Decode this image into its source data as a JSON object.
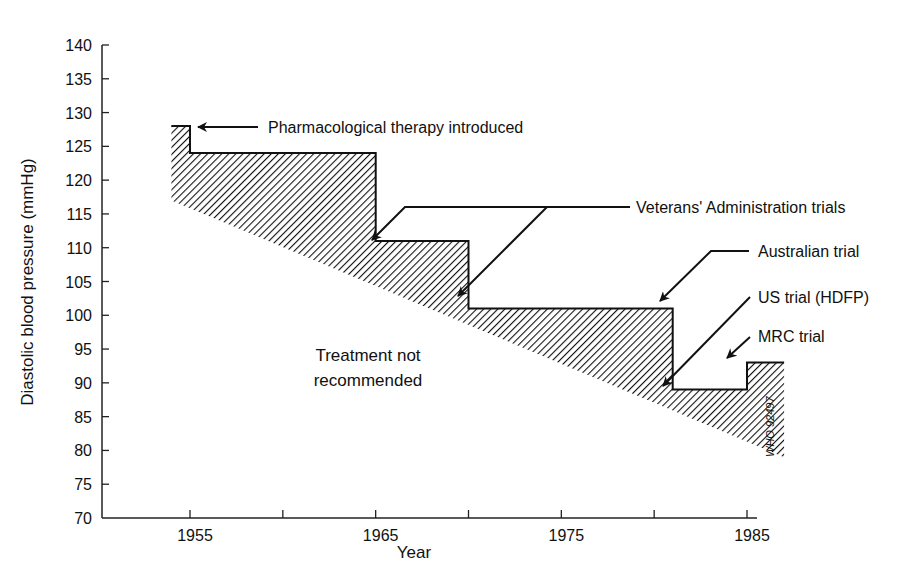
{
  "chart_data": {
    "type": "area",
    "title": "",
    "xlabel": "Year",
    "ylabel": "Diastolic blood pressure (mmHg)",
    "xlim": [
      1950.3,
      1987.5
    ],
    "ylim": [
      70,
      140
    ],
    "grid": false,
    "x_ticks": [
      1955,
      1960,
      1965,
      1970,
      1975,
      1980,
      1985
    ],
    "x_tick_labels": [
      "1955",
      "",
      "1965",
      "",
      "1975",
      "",
      "1985"
    ],
    "y_ticks": [
      70,
      75,
      80,
      85,
      90,
      95,
      100,
      105,
      110,
      115,
      120,
      125,
      130,
      135,
      140
    ],
    "y_tick_labels": [
      "70",
      "75",
      "80",
      "85",
      "90",
      "95",
      "100",
      "105",
      "110",
      "115",
      "120",
      "125",
      "130",
      "135",
      "140"
    ],
    "series": [
      {
        "name": "Treatment threshold (upper step boundary)",
        "step": true,
        "x": [
          1954,
          1955,
          1955,
          1965,
          1965,
          1970,
          1970,
          1981,
          1981,
          1985,
          1985,
          1987
        ],
        "y": [
          128,
          128,
          124,
          124,
          111,
          111,
          101,
          101,
          89,
          89,
          93,
          93
        ]
      },
      {
        "name": "Lower diagonal boundary",
        "x": [
          1954,
          1987
        ],
        "y": [
          117,
          79
        ]
      }
    ],
    "fill": "hatched region between upper step boundary and lower diagonal",
    "annotations": [
      {
        "text": "Pharmacological therapy introduced",
        "points_to": [
          1955,
          128
        ]
      },
      {
        "text": "Veterans' Administration trials",
        "points_to": [
          [
            1965,
            111
          ],
          [
            1970,
            101
          ]
        ]
      },
      {
        "text": "Australian trial",
        "points_to": [
          1981,
          101
        ]
      },
      {
        "text": "US trial (HDFP)",
        "points_to": [
          1981,
          89
        ]
      },
      {
        "text": "MRC trial",
        "points_to": [
          1985,
          93
        ]
      },
      {
        "text": "Treatment not recommended",
        "region": "below hatched area"
      },
      {
        "text": "WHO 92497",
        "rotated": true
      }
    ]
  },
  "labels": {
    "ylabel": "Diastolic blood pressure (mmHg)",
    "xlabel": "Year",
    "pharma": "Pharmacological therapy introduced",
    "va": "Veterans' Administration trials",
    "australian": "Australian trial",
    "us": "US trial (HDFP)",
    "mrc": "MRC trial",
    "not_rec_1": "Treatment not",
    "not_rec_2": "recommended",
    "who": "WHO 92497"
  }
}
